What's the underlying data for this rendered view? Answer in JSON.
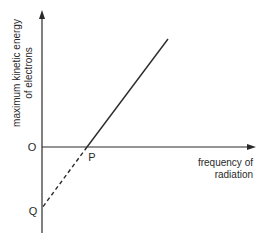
{
  "diagram": {
    "y_axis_label_line1": "maximum kinetic energy",
    "y_axis_label_line2": "of electrons",
    "x_axis_label_line1": "frequency of",
    "x_axis_label_line2": "radiation",
    "origin_label": "O",
    "point_p_label": "P",
    "point_q_label": "Q"
  },
  "colors": {
    "line": "#2a2a2a",
    "background": "#ffffff"
  }
}
